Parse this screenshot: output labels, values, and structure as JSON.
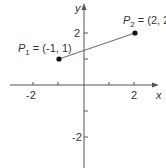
{
  "diagram": {
    "type": "coordinate-plane",
    "axes": {
      "x_label": "x",
      "y_label": "y",
      "x_ticks": [
        -2,
        -1,
        0,
        1,
        2
      ],
      "x_tick_labels": [
        "-2",
        "2"
      ],
      "y_ticks": [
        -2,
        -1,
        1,
        2
      ],
      "y_tick_labels": [
        "2",
        "-2"
      ]
    },
    "points": [
      {
        "name": "P",
        "sub": "1",
        "coords": "(-1, 1)",
        "eq": " = ",
        "x": -1,
        "y": 1
      },
      {
        "name": "P",
        "sub": "2",
        "coords": "(2, 2)",
        "eq": " = ",
        "x": 2,
        "y": 2
      }
    ],
    "segment": {
      "from": "P1",
      "to": "P2"
    },
    "colors": {
      "axis": "#555555",
      "segment": "#777777",
      "point": "#111111",
      "text": "#333333"
    }
  }
}
